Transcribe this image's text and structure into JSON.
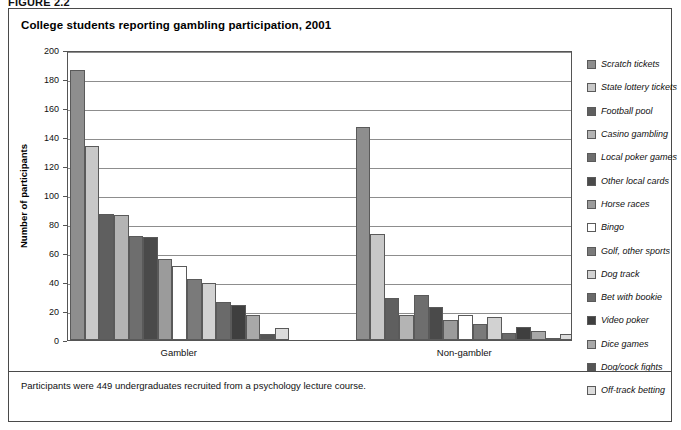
{
  "figure": {
    "number_label": "FIGURE 2.2"
  },
  "panel": {
    "title": "College students reporting gambling participation, 2001",
    "footnote": "Participants were 449 undergraduates recruited from a psychology lecture course."
  },
  "axis": {
    "y_title": "Number of participants",
    "y_ticks": [
      "0",
      "20",
      "40",
      "60",
      "80",
      "100",
      "120",
      "140",
      "160",
      "180",
      "200"
    ],
    "x_groups": [
      "Gambler",
      "Non-gambler"
    ]
  },
  "colors": {
    "series": [
      "#8e8e8e",
      "#c8c8c8",
      "#5f5f5f",
      "#b4b4b4",
      "#6e6e6e",
      "#4a4a4a",
      "#9b9b9b",
      "#ffffff",
      "#7a7a7a",
      "#d2d2d2",
      "#6a6a6a",
      "#3f3f3f",
      "#a8a8a8",
      "#555555",
      "#dcdcdc"
    ],
    "gridline": "#8d8d8d",
    "axis": "#555555",
    "panel_border": "#4a4a4a",
    "bar_outline": "#5a5a5a"
  },
  "chart_data": {
    "type": "bar",
    "title": "College students reporting gambling participation, 2001",
    "xlabel": "",
    "ylabel": "Number of participants",
    "ylim": [
      0,
      200
    ],
    "ytick_step": 20,
    "grid": true,
    "legend_position": "right",
    "categories": [
      "Gambler",
      "Non-gambler"
    ],
    "series": [
      {
        "name": "Scratch tickets",
        "values": [
          186,
          147
        ]
      },
      {
        "name": "State lottery tickets",
        "values": [
          134,
          73
        ]
      },
      {
        "name": "Football pool",
        "values": [
          87,
          29
        ]
      },
      {
        "name": "Casino gambling",
        "values": [
          86,
          17
        ]
      },
      {
        "name": "Local poker games",
        "values": [
          72,
          31
        ]
      },
      {
        "name": "Other local cards",
        "values": [
          71,
          23
        ]
      },
      {
        "name": "Horse races",
        "values": [
          56,
          14
        ]
      },
      {
        "name": "Bingo",
        "values": [
          51,
          17
        ]
      },
      {
        "name": "Golf, other sports",
        "values": [
          42,
          11
        ]
      },
      {
        "name": "Dog track",
        "values": [
          39,
          16
        ]
      },
      {
        "name": "Bet with bookie",
        "values": [
          26,
          5
        ]
      },
      {
        "name": "Video poker",
        "values": [
          24,
          9
        ]
      },
      {
        "name": "Dice games",
        "values": [
          17,
          6
        ]
      },
      {
        "name": "Dog/cock fights",
        "values": [
          4,
          1
        ]
      },
      {
        "name": "Off-track betting",
        "values": [
          8,
          4
        ]
      }
    ],
    "annotation": "Participants were 449 undergraduates recruited from a psychology lecture course."
  },
  "legend": {
    "items": [
      "Scratch tickets",
      "State lottery tickets",
      "Football pool",
      "Casino gambling",
      "Local poker games",
      "Other local cards",
      "Horse races",
      "Bingo",
      "Golf, other sports",
      "Dog track",
      "Bet with bookie",
      "Video poker",
      "Dice games",
      "Dog/cock fights",
      "Off-track betting"
    ]
  }
}
